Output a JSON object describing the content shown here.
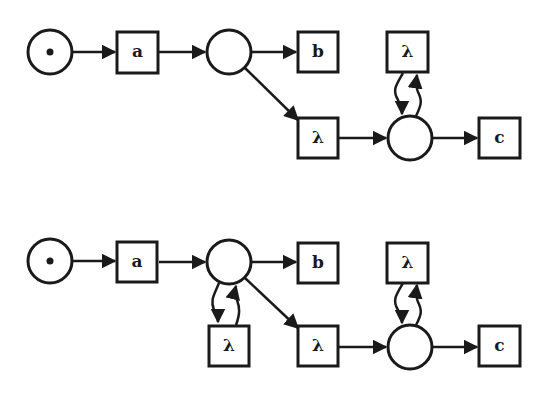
{
  "diagram": {
    "type": "petri-net",
    "nets": [
      {
        "id": "net-1",
        "places": [
          {
            "id": "p1",
            "marked": true
          },
          {
            "id": "p2",
            "marked": false
          },
          {
            "id": "p3",
            "marked": false
          }
        ],
        "transitions": [
          {
            "id": "t_a",
            "label": "a"
          },
          {
            "id": "t_b",
            "label": "b"
          },
          {
            "id": "t_lambda1",
            "label": "λ"
          },
          {
            "id": "t_lambda_loop",
            "label": "λ"
          },
          {
            "id": "t_c",
            "label": "c"
          }
        ],
        "arcs": [
          [
            "p1",
            "t_a"
          ],
          [
            "t_a",
            "p2"
          ],
          [
            "p2",
            "t_b"
          ],
          [
            "p2",
            "t_lambda1"
          ],
          [
            "t_lambda1",
            "p3"
          ],
          [
            "p3",
            "t_lambda_loop"
          ],
          [
            "t_lambda_loop",
            "p3"
          ],
          [
            "p3",
            "t_c"
          ]
        ]
      },
      {
        "id": "net-2",
        "places": [
          {
            "id": "p1",
            "marked": true
          },
          {
            "id": "p2",
            "marked": false
          },
          {
            "id": "p3",
            "marked": false
          }
        ],
        "transitions": [
          {
            "id": "t_a",
            "label": "a"
          },
          {
            "id": "t_b",
            "label": "b"
          },
          {
            "id": "t_lambda_p2loop",
            "label": "λ"
          },
          {
            "id": "t_lambda1",
            "label": "λ"
          },
          {
            "id": "t_lambda_loop",
            "label": "λ"
          },
          {
            "id": "t_c",
            "label": "c"
          }
        ],
        "arcs": [
          [
            "p1",
            "t_a"
          ],
          [
            "t_a",
            "p2"
          ],
          [
            "p2",
            "t_b"
          ],
          [
            "p2",
            "t_lambda_p2loop"
          ],
          [
            "t_lambda_p2loop",
            "p2"
          ],
          [
            "p2",
            "t_lambda1"
          ],
          [
            "t_lambda1",
            "p3"
          ],
          [
            "p3",
            "t_lambda_loop"
          ],
          [
            "t_lambda_loop",
            "p3"
          ],
          [
            "p3",
            "t_c"
          ]
        ]
      }
    ],
    "labels": {
      "a": "a",
      "b": "b",
      "c": "c",
      "lambda": "λ"
    }
  }
}
